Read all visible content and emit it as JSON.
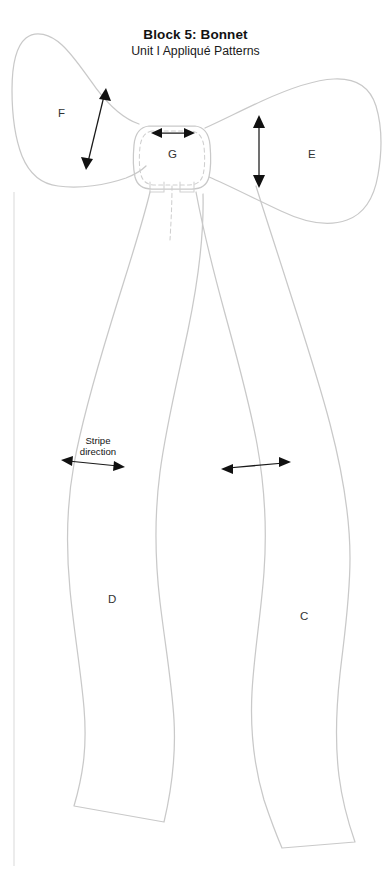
{
  "document": {
    "title_main": "Block 5: Bonnet",
    "title_sub": "Unit I Appliqué Patterns",
    "sheet_background": "#ffffff",
    "outline_color": "#c9c9c9",
    "arrow_color": "#111111",
    "label_color": "#333333"
  },
  "annotations": {
    "grain_note_line1": "Stripe",
    "grain_note_line2": "direction"
  },
  "pieces": [
    {
      "id": "F",
      "label": "F",
      "name": "bow-loop-left",
      "grain": "diagonal",
      "x": 62,
      "y": 114
    },
    {
      "id": "G",
      "label": "G",
      "name": "bow-knot",
      "grain": "horizontal",
      "x": 172,
      "y": 155
    },
    {
      "id": "E",
      "label": "E",
      "name": "bow-loop-right",
      "grain": "vertical",
      "x": 312,
      "y": 155
    },
    {
      "id": "D",
      "label": "D",
      "name": "ribbon-tail-left",
      "grain": "horizontal",
      "x": 112,
      "y": 600
    },
    {
      "id": "C",
      "label": "C",
      "name": "ribbon-tail-right",
      "grain": "horizontal",
      "x": 304,
      "y": 617
    }
  ],
  "grain_arrows": [
    {
      "piece": "F",
      "orientation": "diagonal",
      "double_headed": true,
      "labeled": false
    },
    {
      "piece": "G",
      "orientation": "horizontal",
      "double_headed": true,
      "labeled": false
    },
    {
      "piece": "E",
      "orientation": "vertical",
      "double_headed": true,
      "labeled": false
    },
    {
      "piece": "D",
      "orientation": "horizontal",
      "double_headed": true,
      "labeled": true
    },
    {
      "piece": "C",
      "orientation": "horizontal",
      "double_headed": true,
      "labeled": false
    }
  ]
}
